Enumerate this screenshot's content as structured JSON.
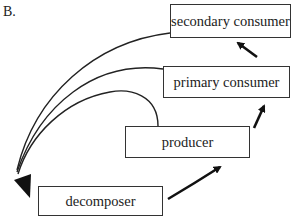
{
  "figure_label": "B.",
  "nodes": {
    "secondary_consumer": "secondary consumer",
    "primary_consumer": "primary consumer",
    "producer": "producer",
    "decomposer": "decomposer"
  },
  "edges": [
    {
      "from": "decomposer",
      "to": "producer"
    },
    {
      "from": "producer",
      "to": "primary consumer"
    },
    {
      "from": "primary consumer",
      "to": "secondary consumer"
    },
    {
      "from": "producer",
      "to": "decomposer"
    },
    {
      "from": "primary consumer",
      "to": "decomposer"
    },
    {
      "from": "secondary consumer",
      "to": "decomposer"
    }
  ],
  "colors": {
    "line": "#222222",
    "box_border": "#333333",
    "background": "#ffffff"
  }
}
